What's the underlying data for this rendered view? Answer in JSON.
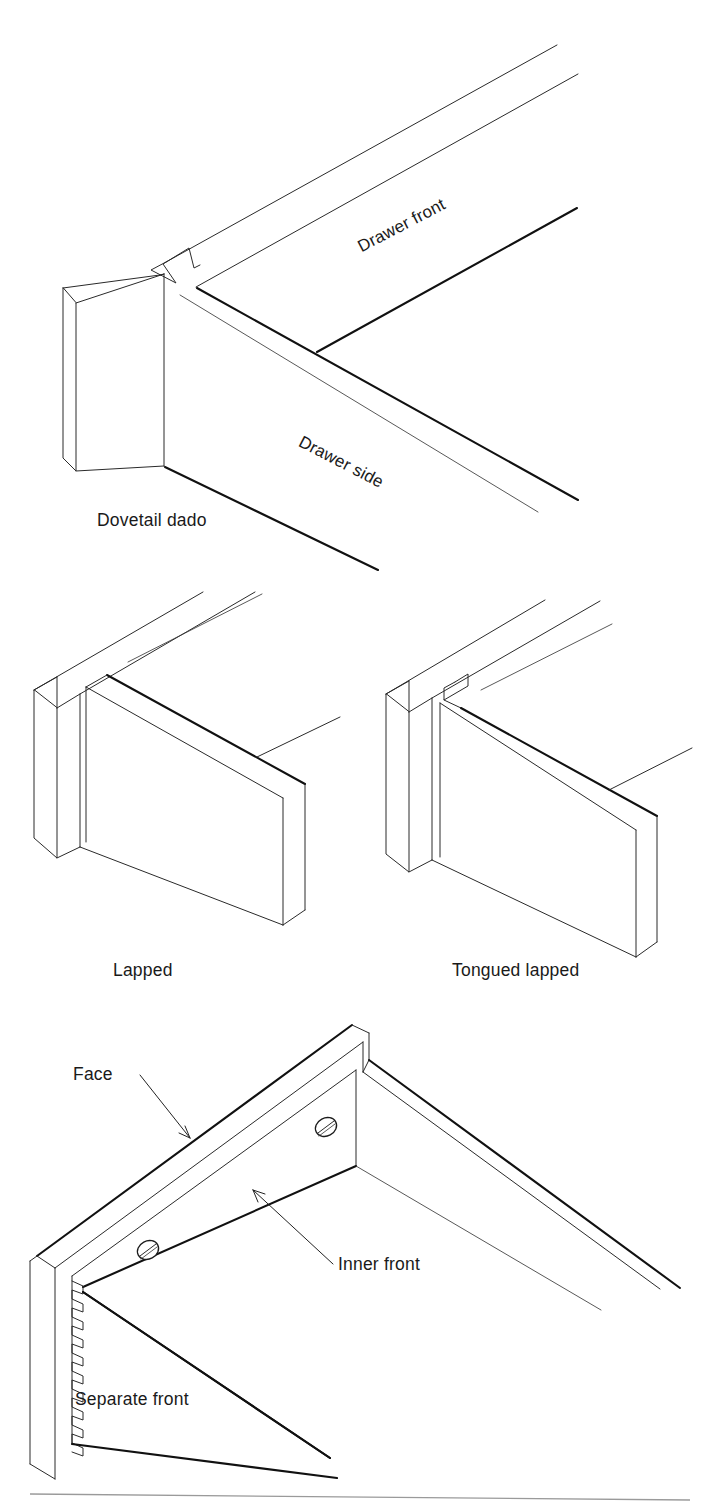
{
  "figure": {
    "kind": "technical-line-illustration",
    "background_color": "#ffffff",
    "ink_color": "#111111",
    "panels": [
      {
        "id": "dovetail-dado",
        "caption": "Dovetail dado",
        "part_labels": [
          "Drawer front",
          "Drawer side"
        ]
      },
      {
        "id": "lapped",
        "caption": "Lapped",
        "part_labels": []
      },
      {
        "id": "tongued-lapped",
        "caption": "Tongued lapped",
        "part_labels": []
      },
      {
        "id": "separate-front",
        "caption": "Separate front",
        "part_labels": [
          "Face",
          "Inner front"
        ],
        "hardware": "two slotted screw heads",
        "joint_edge": "dovetail pins"
      }
    ]
  },
  "labels": {
    "drawer_front": "Drawer front",
    "drawer_side": "Drawer side",
    "dovetail_dado": "Dovetail dado",
    "lapped": "Lapped",
    "tongued_lapped": "Tongued lapped",
    "face": "Face",
    "inner_front": "Inner front",
    "separate_front": "Separate front"
  }
}
